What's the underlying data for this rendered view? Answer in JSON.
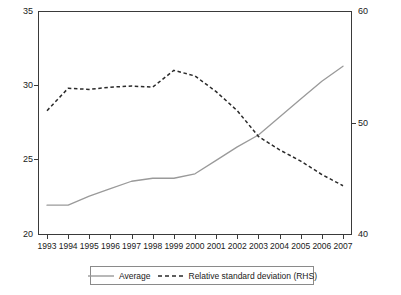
{
  "chart_data": {
    "type": "line",
    "title": "",
    "xlabel": "",
    "ylabel": "",
    "y2label": "",
    "grid": false,
    "legend_position": "bottom",
    "categories": [
      "1993",
      "1994",
      "1995",
      "1996",
      "1997",
      "1998",
      "1999",
      "2000",
      "2001",
      "2002",
      "2003",
      "2004",
      "2005",
      "2006",
      "2007"
    ],
    "ylim": [
      20,
      35
    ],
    "y_ticks": [
      "20",
      "25",
      "30",
      "35"
    ],
    "y2lim": [
      40,
      60
    ],
    "y2_ticks": [
      "40",
      "50",
      "60"
    ],
    "series": [
      {
        "name": "Average",
        "axis": "left",
        "style": "solid",
        "color": "#9a9a9a",
        "values": [
          22.0,
          22.0,
          22.6,
          23.1,
          23.6,
          23.8,
          23.8,
          24.1,
          25.0,
          25.9,
          26.7,
          27.9,
          29.1,
          30.3,
          31.3
        ]
      },
      {
        "name": "Relative standard deviation (RHS)",
        "axis": "right",
        "style": "dashed",
        "color": "#2a2a2a",
        "values": [
          51.1,
          53.1,
          53.0,
          53.2,
          53.3,
          53.2,
          54.7,
          54.2,
          52.8,
          51.1,
          48.8,
          47.6,
          46.6,
          45.4,
          44.4
        ]
      }
    ]
  },
  "legend": {
    "entries": [
      {
        "label": "Average"
      },
      {
        "label": "Relative standard deviation (RHS)"
      }
    ]
  },
  "axes": {
    "left_ticks": [
      "35",
      "30",
      "25",
      "20"
    ],
    "right_ticks": [
      "60",
      "50",
      "40"
    ]
  }
}
